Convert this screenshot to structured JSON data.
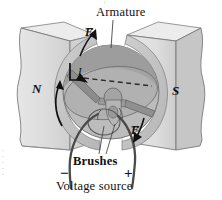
{
  "figure": {
    "type": "dc-motor-diagram",
    "title": "Armature",
    "labels": {
      "armature": "Armature",
      "brushes": "Brushes",
      "voltage_source": "Voltage source",
      "north_pole": "N",
      "south_pole": "S",
      "current": "I",
      "force_upper": "F",
      "force_lower": "F",
      "terminal_negative": "−",
      "terminal_positive": "+"
    },
    "colors": {
      "magnet_face": "#d8d8d8",
      "magnet_top": "#e4e4e4",
      "magnet_side": "#c9c9c9",
      "pole_piece": "#c2c2c2",
      "pole_gap": "#ffffff",
      "armature_light": "#bdbdbd",
      "armature_dark": "#9a9a9a",
      "coil_bar": "#8f8f8f",
      "wire": "#4a4a4a",
      "outline": "#5a5a5a",
      "ink": "#111111"
    },
    "annotations": {
      "rotation_arrow": "counterclockwise-rotation",
      "current_arrow": "current-direction",
      "armature_leader": "leader-line-to-coil",
      "brush_leaders": "two-leader-lines-to-brushes"
    }
  }
}
